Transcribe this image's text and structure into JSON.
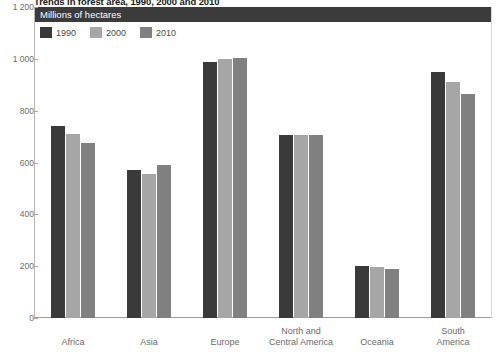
{
  "title": "Trends in forest area, 1990, 2000 and 2010",
  "unit_banner": "Millions of hectares",
  "legend": {
    "position": "top-left",
    "entries": [
      {
        "label": "1990",
        "color": "#3a3a3a"
      },
      {
        "label": "2000",
        "color": "#a6a6a6"
      },
      {
        "label": "2010",
        "color": "#808080"
      }
    ]
  },
  "yaxis": {
    "ticks": [
      "0",
      "200",
      "400",
      "600",
      "800",
      "1 000",
      "1 200"
    ],
    "values": [
      0,
      200,
      400,
      600,
      800,
      1000,
      1200
    ]
  },
  "chart_data": {
    "type": "bar",
    "title": "Trends in forest area, 1990, 2000 and 2010",
    "xlabel": "",
    "ylabel": "Millions of hectares",
    "ylim": [
      0,
      1200
    ],
    "ytick_step": 200,
    "grid": false,
    "legend_position": "top-left",
    "categories": [
      "Africa",
      "Asia",
      "Europe",
      "North and Central America",
      "Oceania",
      "South America"
    ],
    "series": [
      {
        "name": "1990",
        "color": "#3a3a3a",
        "values": [
          740,
          573,
          989,
          708,
          199,
          950
        ]
      },
      {
        "name": "2000",
        "color": "#a6a6a6",
        "values": [
          710,
          556,
          998,
          706,
          198,
          910
        ]
      },
      {
        "name": "2010",
        "color": "#808080",
        "values": [
          674,
          592,
          1005,
          705,
          191,
          864
        ]
      }
    ]
  },
  "xaxis": {
    "labels": [
      {
        "line1": "Africa",
        "line2": ""
      },
      {
        "line1": "Asia",
        "line2": ""
      },
      {
        "line1": "Europe",
        "line2": ""
      },
      {
        "line1": "North and",
        "line2": "Central America"
      },
      {
        "line1": "Oceania",
        "line2": ""
      },
      {
        "line1": "South",
        "line2": "America"
      }
    ]
  }
}
